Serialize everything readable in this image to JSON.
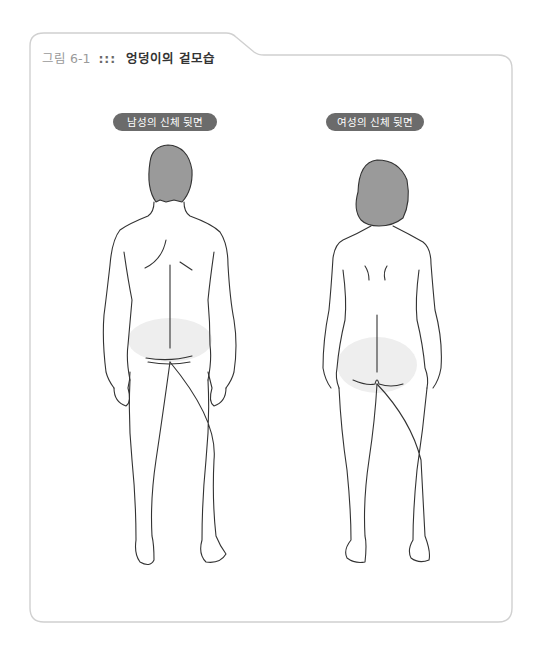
{
  "figure": {
    "number": "그림 6-1",
    "separator": ":::",
    "caption": "엉덩이의 겉모습"
  },
  "panels": [
    {
      "label": "남성의 신체  뒷면",
      "subject": "male-back-view"
    },
    {
      "label": "여성의 신체  뒷면",
      "subject": "female-back-view"
    }
  ],
  "colors": {
    "frame_stroke": "#d0d0d0",
    "pill_background": "#6b6b6b",
    "hair_fill": "#9a9a9a",
    "buttock_highlight": "#eeeeee",
    "outline": "#333333"
  }
}
